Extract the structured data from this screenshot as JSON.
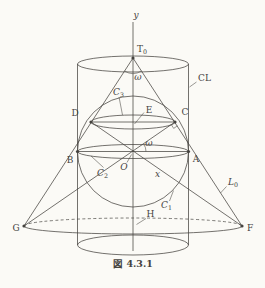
{
  "figure": {
    "caption": "図 4.3.1",
    "colors": {
      "line": "#45433f",
      "background": "#fbfaf6"
    },
    "labels": {
      "y_axis": "y",
      "x_axis": "x",
      "apex_base": "T",
      "apex_sub": "0",
      "omega_apex": "ω",
      "omega_center": "ω",
      "cylinder": "CL",
      "generator_base": "L",
      "generator_sub": "0",
      "circle1_base": "C",
      "circle1_sub": "1",
      "circle2_base": "C",
      "circle2_sub": "2",
      "circle3_base": "C",
      "circle3_sub": "3",
      "point_d": "D",
      "point_e": "E",
      "point_c": "C",
      "point_b": "B",
      "point_a": "A",
      "point_o": "O",
      "point_g": "G",
      "point_h": "H",
      "point_f": "F"
    }
  }
}
